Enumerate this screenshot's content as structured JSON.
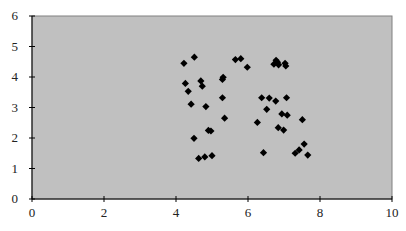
{
  "chart_data": {
    "type": "scatter",
    "title": "",
    "xlabel": "",
    "ylabel": "",
    "xlim": [
      0,
      10
    ],
    "ylim": [
      0,
      6
    ],
    "x_ticks": [
      0,
      2,
      4,
      6,
      8,
      10
    ],
    "y_ticks": [
      0,
      1,
      2,
      3,
      4,
      5,
      6
    ],
    "grid": false,
    "legend": null,
    "marker": "diamond",
    "colors": {
      "plot_background": "#c0c0c0",
      "plot_border": "#808080",
      "marker": "#000000",
      "axis": "#000000"
    },
    "series": [
      {
        "name": "points",
        "points": [
          [
            4.22,
            4.45
          ],
          [
            4.51,
            4.65
          ],
          [
            5.65,
            4.57
          ],
          [
            5.8,
            4.6
          ],
          [
            5.98,
            4.32
          ],
          [
            6.72,
            4.42
          ],
          [
            6.78,
            4.55
          ],
          [
            6.82,
            4.48
          ],
          [
            6.85,
            4.4
          ],
          [
            7.03,
            4.45
          ],
          [
            7.05,
            4.36
          ],
          [
            4.26,
            3.79
          ],
          [
            4.69,
            3.87
          ],
          [
            4.73,
            3.7
          ],
          [
            5.31,
            3.99
          ],
          [
            5.29,
            3.92
          ],
          [
            4.34,
            3.53
          ],
          [
            4.42,
            3.11
          ],
          [
            4.83,
            3.03
          ],
          [
            5.29,
            3.32
          ],
          [
            5.35,
            2.65
          ],
          [
            4.9,
            2.25
          ],
          [
            4.97,
            2.23
          ],
          [
            4.5,
            1.99
          ],
          [
            4.63,
            1.33
          ],
          [
            4.8,
            1.38
          ],
          [
            5.0,
            1.42
          ],
          [
            6.38,
            3.32
          ],
          [
            6.59,
            3.31
          ],
          [
            6.77,
            3.21
          ],
          [
            7.07,
            3.32
          ],
          [
            6.52,
            2.94
          ],
          [
            6.94,
            2.79
          ],
          [
            7.09,
            2.75
          ],
          [
            6.26,
            2.51
          ],
          [
            7.51,
            2.6
          ],
          [
            6.84,
            2.34
          ],
          [
            6.99,
            2.26
          ],
          [
            7.56,
            1.8
          ],
          [
            7.42,
            1.61
          ],
          [
            7.31,
            1.5
          ],
          [
            7.66,
            1.44
          ],
          [
            6.43,
            1.52
          ]
        ]
      }
    ]
  }
}
